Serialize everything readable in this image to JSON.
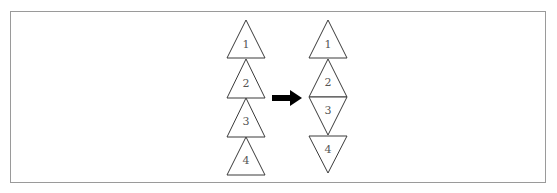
{
  "diagram": {
    "colors": {
      "stroke": "#3a3a3a",
      "label": "#555555",
      "arrow": "#000000",
      "frame": "#9a9a9a"
    },
    "left_stack": {
      "triangles": [
        {
          "label": "1",
          "orientation": "up"
        },
        {
          "label": "2",
          "orientation": "up"
        },
        {
          "label": "3",
          "orientation": "up"
        },
        {
          "label": "4",
          "orientation": "up"
        }
      ]
    },
    "arrow": {
      "direction": "right",
      "icon": "arrow-right-icon"
    },
    "right_stack": {
      "triangles": [
        {
          "label": "1",
          "orientation": "up"
        },
        {
          "label": "2",
          "orientation": "up"
        },
        {
          "label": "3",
          "orientation": "down"
        },
        {
          "label": "4",
          "orientation": "down"
        }
      ]
    }
  }
}
